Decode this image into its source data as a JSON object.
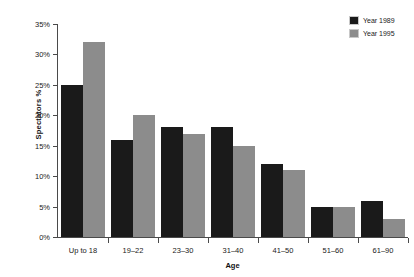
{
  "chart_data": {
    "type": "bar",
    "title": "",
    "xlabel": "Age",
    "ylabel": "Spectators %",
    "categories": [
      "Up to 18",
      "19–22",
      "23–30",
      "31–40",
      "41–50",
      "51–60",
      "61–90"
    ],
    "series": [
      {
        "name": "Year 1989",
        "color": "#1a1a1a",
        "values": [
          25,
          16,
          18,
          18,
          12,
          5,
          6
        ]
      },
      {
        "name": "Year 1995",
        "color": "#8c8c8c",
        "values": [
          32,
          20,
          17,
          15,
          11,
          5,
          3
        ]
      }
    ],
    "ylim": [
      0,
      35
    ],
    "ytick_values": [
      0,
      5,
      10,
      15,
      20,
      25,
      30,
      35
    ],
    "ytick_labels": [
      "0%",
      "5%",
      "10%",
      "15%",
      "20%",
      "25%",
      "30%",
      "35%"
    ],
    "grid": false,
    "legend_position": "top-right",
    "unit": "%"
  },
  "legend": {
    "items": [
      {
        "label": "Year 1989"
      },
      {
        "label": "Year 1995"
      }
    ]
  }
}
